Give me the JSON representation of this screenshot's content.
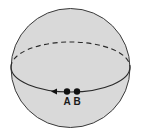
{
  "diagram": {
    "type": "sphere-with-equator",
    "colors": {
      "sphere_fill": "#d9d9d9",
      "outline": "#3a3a3a",
      "equator": "#2a2a2a",
      "points": "#111111",
      "background": "#ffffff"
    },
    "sphere": {
      "cx": 70.5,
      "cy": 68,
      "r": 59.5
    },
    "equator": {
      "cx": 70.5,
      "cy": 67,
      "rx": 59.5,
      "ry": 25,
      "back_style": "dashed",
      "front_style": "solid"
    },
    "arrow": {
      "x": 54,
      "y": 91.5,
      "direction": "left"
    },
    "points": [
      {
        "label": "A",
        "x": 67,
        "y": 91.5
      },
      {
        "label": "B",
        "x": 77,
        "y": 91.5
      }
    ]
  }
}
